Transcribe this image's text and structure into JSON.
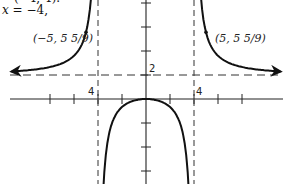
{
  "caption": {
    "line1": "(−4, 4).",
    "line2_var": "x",
    "line2_rest": " = −4,"
  },
  "labels": {
    "h_asymptote": "2",
    "v_asymptote_left": "4",
    "v_asymptote_right": "4",
    "point_left": "(−5, 5 5/9)",
    "point_right": "(5, 5 5/9)"
  },
  "chart_data": {
    "type": "line",
    "title": "",
    "function": "f(x) = 2x^2 / (x^2 - 16)",
    "xlabel": "",
    "ylabel": "",
    "xlim": [
      -12,
      12
    ],
    "ylim": [
      -7,
      8
    ],
    "tick_spacing": 2,
    "grid": false,
    "vertical_asymptotes": [
      -4,
      4
    ],
    "horizontal_asymptote": 2,
    "annotations": [
      {
        "text": "(-5, 5 5/9)",
        "x": -5,
        "y": 5.556
      },
      {
        "text": "(5, 5 5/9)",
        "x": 5,
        "y": 5.556
      },
      {
        "text": "2",
        "at": "horizontal asymptote y=2"
      },
      {
        "text": "4",
        "at": "vertical asymptote x=-4"
      },
      {
        "text": "4",
        "at": "vertical asymptote x=4"
      }
    ],
    "series": [
      {
        "name": "left branch",
        "x": [
          -11,
          -9,
          -7,
          -6,
          -5,
          -4.5
        ],
        "y": [
          2.3,
          2.49,
          2.97,
          3.6,
          5.56,
          9.53
        ]
      },
      {
        "name": "middle branch",
        "x": [
          -3.6,
          -3,
          -2,
          -1,
          0,
          1,
          2,
          3,
          3.6
        ],
        "y": [
          -13.6,
          -4.6,
          -0.67,
          -0.13,
          0,
          -0.13,
          -0.67,
          -4.6,
          -13.6
        ]
      },
      {
        "name": "right branch",
        "x": [
          4.5,
          5,
          6,
          7,
          9,
          11
        ],
        "y": [
          9.53,
          5.56,
          3.6,
          2.97,
          2.49,
          2.3
        ]
      }
    ]
  }
}
